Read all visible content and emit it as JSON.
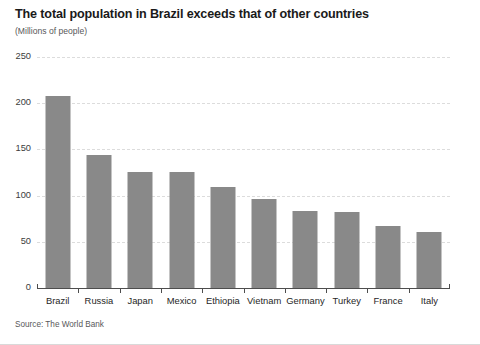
{
  "chart_data": {
    "type": "bar",
    "title": "The total population in Brazil exceeds that of other countries",
    "subtitle": "(Millions of people)",
    "xlabel": "",
    "ylabel": "(Millions of people)",
    "source": "Source: The World Bank",
    "categories": [
      "Brazil",
      "Russia",
      "Japan",
      "Mexico",
      "Ethiopia",
      "Vietnam",
      "Germany",
      "Turkey",
      "France",
      "Italy"
    ],
    "values": [
      208,
      144,
      126,
      126,
      109,
      96,
      83,
      82,
      67,
      61
    ],
    "ylim": [
      0,
      250
    ],
    "yticks": [
      250,
      200,
      150,
      100,
      50,
      0
    ],
    "ytick_labels": [
      "250",
      "200",
      "150",
      "100",
      "50",
      "0"
    ],
    "grid": true,
    "legend": false,
    "legend_position": "none",
    "bar_color": "#898989",
    "grid_color": "#dcdcdc",
    "axis_color": "#4d4d4d",
    "title_color": "#1a1a1a",
    "subtitle_color": "#58585a",
    "background": "#ffffff"
  }
}
